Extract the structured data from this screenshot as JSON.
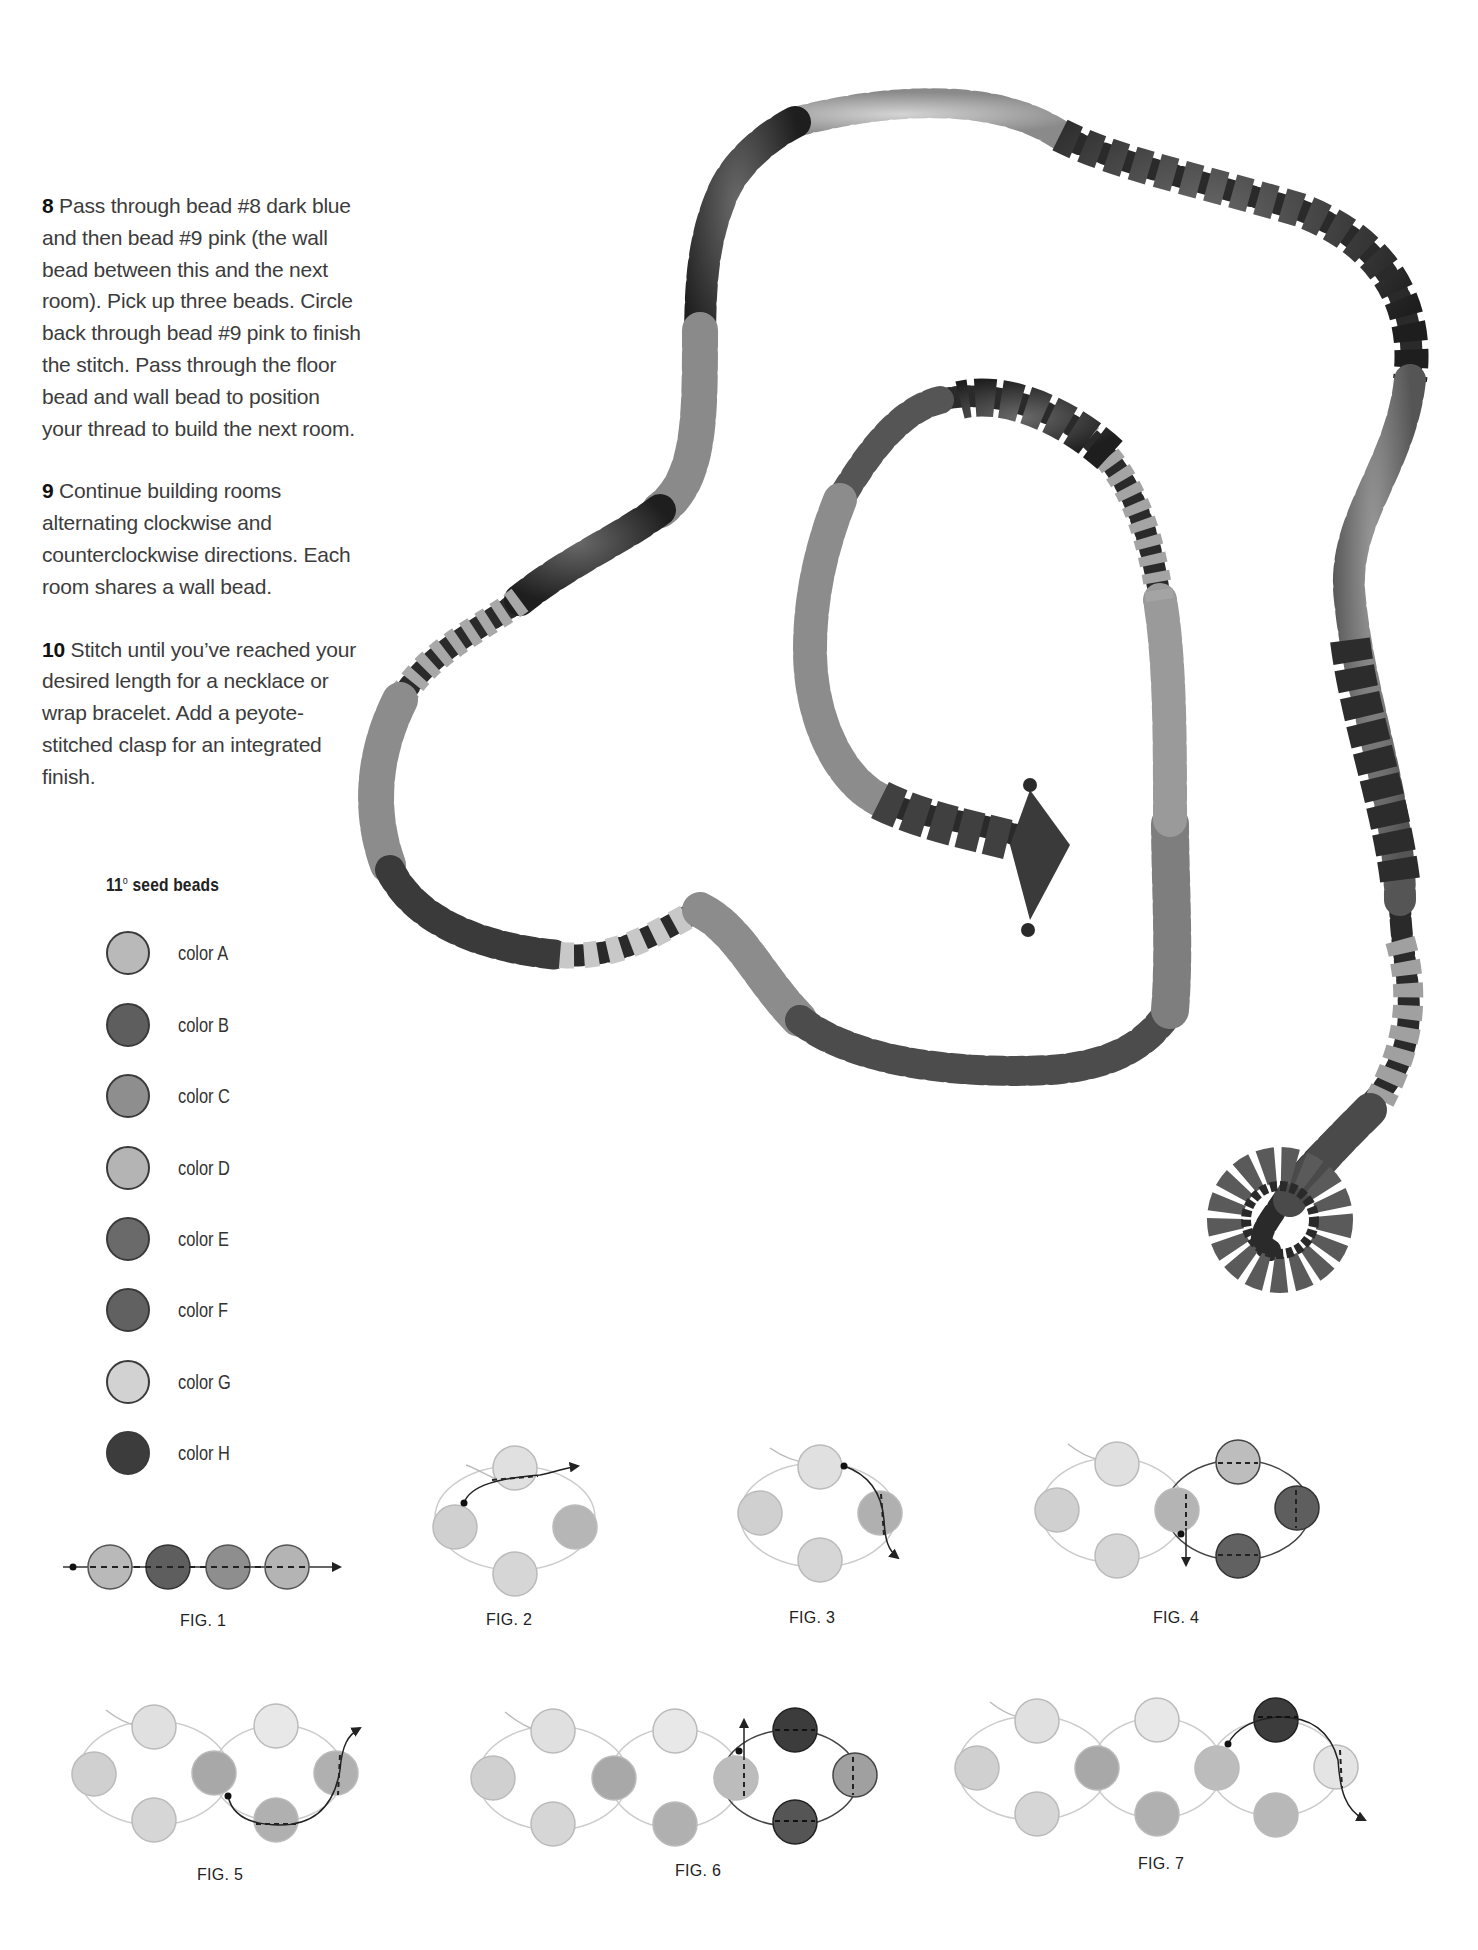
{
  "instructions": [
    {
      "number": "8",
      "text": " Pass through bead #8 dark blue and then bead #9 pink (the wall bead between this and the next room). Pick up three beads. Circle back through bead #9 pink to finish the stitch. Pass through the floor bead and wall bead to position your thread to build the next room."
    },
    {
      "number": "9",
      "text": " Continue building rooms alternating clockwise and counterclockwise directions. Each room shares a wall bead."
    },
    {
      "number": "10",
      "text": " Stitch until you’ve reached your desired length for a necklace or wrap bracelet. Add a peyote-stitched clasp for an integrated finish."
    }
  ],
  "legend": {
    "title_prefix": "11",
    "title_degree": "o",
    "title_suffix": " seed beads",
    "items": [
      {
        "label": "color A",
        "color": "#b9b9b9"
      },
      {
        "label": "color B",
        "color": "#5e5e5e"
      },
      {
        "label": "color C",
        "color": "#8e8e8e"
      },
      {
        "label": "color D",
        "color": "#b4b4b4"
      },
      {
        "label": "color E",
        "color": "#6a6a6a"
      },
      {
        "label": "color F",
        "color": "#616161"
      },
      {
        "label": "color G",
        "color": "#d2d2d2"
      },
      {
        "label": "color H",
        "color": "#3c3c3c"
      }
    ]
  },
  "figures": [
    {
      "label": "FIG. 1"
    },
    {
      "label": "FIG. 2"
    },
    {
      "label": "FIG. 3"
    },
    {
      "label": "FIG. 4"
    },
    {
      "label": "FIG. 5"
    },
    {
      "label": "FIG. 6"
    },
    {
      "label": "FIG. 7"
    }
  ],
  "photo": {
    "subject": "beaded-necklace-photo"
  }
}
